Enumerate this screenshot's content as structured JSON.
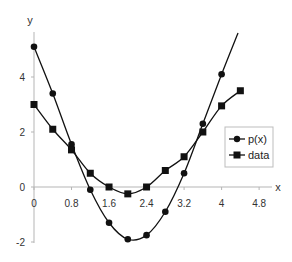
{
  "chart_data": {
    "type": "line",
    "title": "",
    "xlabel": "x",
    "ylabel": "y",
    "xlim": [
      0,
      4.8
    ],
    "ylim": [
      -2,
      5
    ],
    "x_ticks": [
      "0",
      "0.8",
      "1.6",
      "2.4",
      "3.2",
      "4",
      "4.8"
    ],
    "y_ticks": [
      "-2",
      "0",
      "2",
      "4"
    ],
    "grid": false,
    "legend_position": "right-middle",
    "series": [
      {
        "name": "p(x)",
        "marker": "circle",
        "smooth": true,
        "x": [
          0,
          0.4,
          0.8,
          1.2,
          1.6,
          2.0,
          2.4,
          2.8,
          3.2,
          3.6,
          4.0
        ],
        "y": [
          5.1,
          3.4,
          1.55,
          -0.1,
          -1.3,
          -1.9,
          -1.75,
          -0.9,
          0.5,
          2.3,
          4.1
        ],
        "line_extends_to": {
          "x": 4.35,
          "y": 5.6
        }
      },
      {
        "name": "data",
        "marker": "square",
        "smooth": true,
        "x": [
          0,
          0.4,
          0.8,
          1.2,
          1.6,
          2.0,
          2.4,
          2.8,
          3.2,
          3.6,
          4.0,
          4.4
        ],
        "y": [
          3.0,
          2.1,
          1.35,
          0.5,
          0.0,
          -0.25,
          0.0,
          0.6,
          1.1,
          2.0,
          2.95,
          3.5
        ]
      }
    ]
  },
  "legend": {
    "items": [
      {
        "label": "p(x)",
        "marker": "circle"
      },
      {
        "label": "data",
        "marker": "square"
      }
    ]
  },
  "colors": {
    "series": "#111111",
    "axis": "#b0b0b0",
    "text": "#333333"
  }
}
